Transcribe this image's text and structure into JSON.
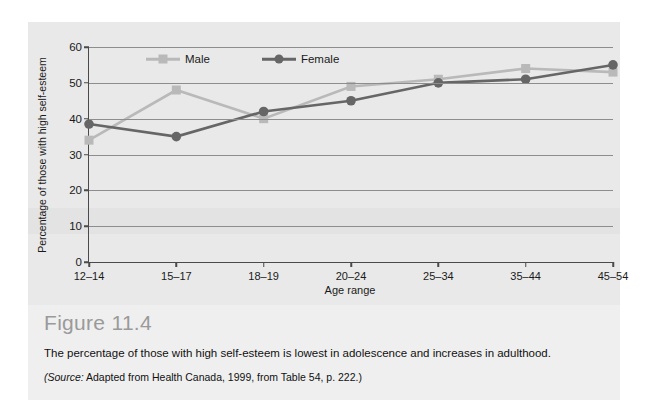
{
  "figure": {
    "title": "Figure 11.4",
    "description": "The percentage of those with high self-esteem is lowest in adolescence and increases in adulthood.",
    "source_prefix": "(Source:",
    "source_text": " Adapted from Health Canada, 1999, from Table 54, p. 222.)"
  },
  "colors": {
    "male": "#b9b9b9",
    "female": "#666666",
    "axis": "#4a4a4a",
    "grid": "#8d8d8d",
    "background": "#e9e9e9",
    "title": "#9a9a9a"
  },
  "chart_data": {
    "type": "line",
    "title": "",
    "xlabel": "Age range",
    "ylabel": "Percentage of those with high self-esteem",
    "categories": [
      "12–14",
      "15–17",
      "18–19",
      "20–24",
      "25–34",
      "35–44",
      "45–54"
    ],
    "ylim": [
      0,
      60
    ],
    "yticks": [
      0,
      10,
      20,
      30,
      40,
      50,
      60
    ],
    "grid": true,
    "legend_position": "top-inside",
    "series": [
      {
        "name": "Male",
        "marker": "square",
        "color": "#b9b9b9",
        "values": [
          34,
          48,
          40,
          49,
          51,
          54,
          53
        ]
      },
      {
        "name": "Female",
        "marker": "circle",
        "color": "#666666",
        "values": [
          38.5,
          35,
          42,
          45,
          50,
          51,
          55
        ]
      }
    ]
  }
}
